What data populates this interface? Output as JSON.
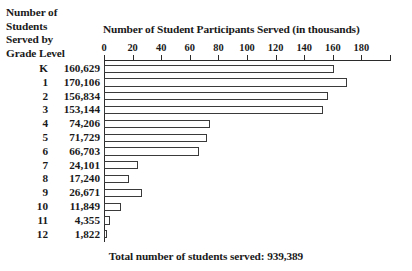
{
  "chart_data": {
    "type": "bar",
    "orientation": "horizontal",
    "title": "",
    "side_title_lines": [
      "Number of",
      "Students",
      "Served by",
      "Grade Level"
    ],
    "xlabel": "Number of Student Participants Served (in thousands)",
    "ylabel": "Grade Level",
    "xlim": [
      0,
      200
    ],
    "xticks": [
      0,
      20,
      40,
      60,
      80,
      100,
      120,
      140,
      160,
      180
    ],
    "xtick_labels": [
      "0",
      "20",
      "40",
      "60",
      "80",
      "100",
      "120",
      "140",
      "160",
      "180"
    ],
    "grid": false,
    "legend": "none",
    "units": "thousands",
    "categories": [
      "K",
      "1",
      "2",
      "3",
      "4",
      "5",
      "6",
      "7",
      "8",
      "9",
      "10",
      "11",
      "12"
    ],
    "values": [
      160629,
      170106,
      156834,
      153144,
      74206,
      71729,
      66703,
      24101,
      17240,
      26671,
      11849,
      4355,
      1822
    ],
    "value_labels": [
      "160,629",
      "170,106",
      "156,834",
      "153,144",
      "74,206",
      "71,729",
      "66,703",
      "24,101",
      "17,240",
      "26,671",
      "11,849",
      "4,355",
      "1,822"
    ],
    "annotation": "Total number of students served: 939,389",
    "total": 939389,
    "bar_face_color": "#ffffff",
    "bar_edge_color": "#3a3a3a",
    "axis_color": "#2b2b2b",
    "background_color": "#ffffff",
    "text_color": "#1a1a1a"
  }
}
